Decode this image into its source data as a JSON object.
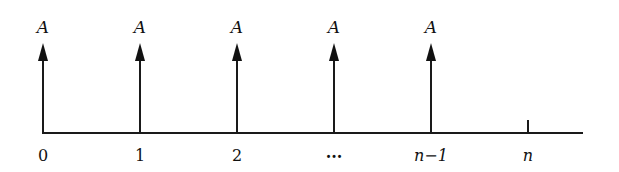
{
  "diagram": {
    "type": "cash-flow-diagram",
    "axis": {
      "x_start": 43,
      "x_end": 583,
      "y": 133,
      "color": "#1a1a1a"
    },
    "flows": [
      {
        "period_label": "0",
        "flow_label": "A",
        "x": 43,
        "has_arrow": true,
        "italic_period": false
      },
      {
        "period_label": "1",
        "flow_label": "A",
        "x": 140,
        "has_arrow": true,
        "italic_period": false
      },
      {
        "period_label": "2",
        "flow_label": "A",
        "x": 237,
        "has_arrow": true,
        "italic_period": false
      },
      {
        "period_label": "...",
        "flow_label": "A",
        "x": 334,
        "has_arrow": true,
        "italic_period": false
      },
      {
        "period_label": "n−1",
        "flow_label": "A",
        "x": 431,
        "has_arrow": true,
        "italic_period": true
      },
      {
        "period_label": "n",
        "flow_label": "",
        "x": 528,
        "has_arrow": false,
        "italic_period": true
      }
    ]
  }
}
